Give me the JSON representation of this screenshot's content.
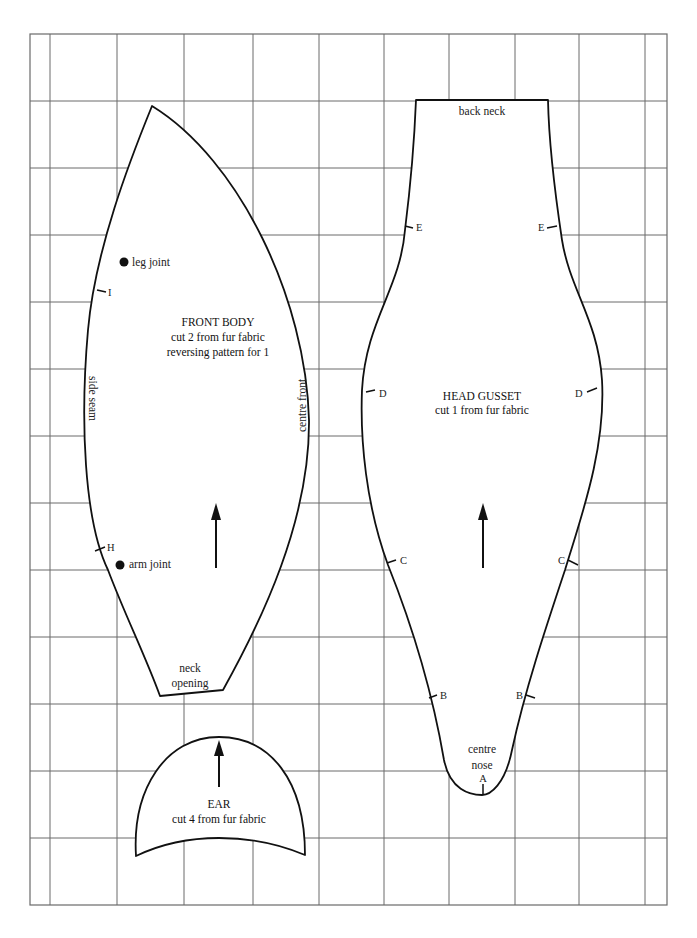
{
  "diagram": {
    "type": "sewing-pattern",
    "grid": {
      "vertical_lines_x": [
        50,
        117,
        184,
        253,
        319,
        384,
        449,
        515,
        579,
        645
      ],
      "horizontal_lines_y": [
        101,
        168,
        235,
        302,
        369,
        436,
        503,
        570,
        637,
        704,
        771,
        838
      ],
      "border": {
        "left": 30,
        "top": 34,
        "right": 667,
        "bottom": 905
      }
    },
    "colors": {
      "outline": "#111111",
      "grid": "#6a6a6a",
      "background": "#ffffff"
    },
    "pieces": {
      "front_body": {
        "title": "FRONT BODY",
        "line1": "cut 2 from fur fabric",
        "line2": "reversing pattern for 1",
        "side_label": "side seam",
        "front_label": "centre front",
        "neck_label_1": "neck",
        "neck_label_2": "opening",
        "leg_joint": "leg joint",
        "arm_joint": "arm joint",
        "mark_i": "I",
        "mark_h": "H",
        "grain_arrow": "grain-arrow-up"
      },
      "head_gusset": {
        "title": "HEAD GUSSET",
        "line1": "cut 1 from fur fabric",
        "back_neck": "back neck",
        "centre": "centre",
        "nose": "nose",
        "mark_a": "A",
        "mark_b": "B",
        "mark_c": "C",
        "mark_d": "D",
        "mark_e": "E",
        "grain_arrow": "grain-arrow-up"
      },
      "ear": {
        "title": "EAR",
        "line1": "cut 4 from fur fabric",
        "grain_arrow": "grain-arrow-up"
      }
    }
  }
}
